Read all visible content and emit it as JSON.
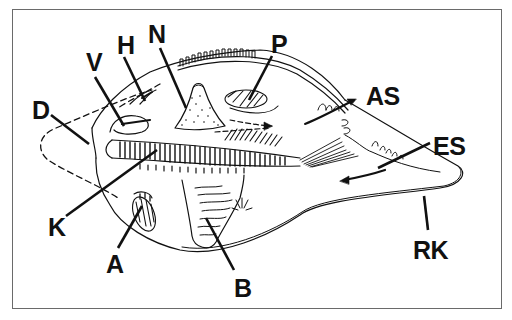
{
  "figure": {
    "labels": [
      {
        "id": "N",
        "text": "N",
        "x": 148,
        "y": 25
      },
      {
        "id": "H",
        "text": "H",
        "x": 118,
        "y": 36
      },
      {
        "id": "V",
        "text": "V",
        "x": 86,
        "y": 52
      },
      {
        "id": "P",
        "text": "P",
        "x": 272,
        "y": 34
      },
      {
        "id": "AS",
        "text": "AS",
        "x": 368,
        "y": 84
      },
      {
        "id": "D",
        "text": "D",
        "x": 32,
        "y": 98
      },
      {
        "id": "ES",
        "text": "ES",
        "x": 434,
        "y": 134
      },
      {
        "id": "K",
        "text": "K",
        "x": 47,
        "y": 214
      },
      {
        "id": "A",
        "text": "A",
        "x": 105,
        "y": 250
      },
      {
        "id": "RK",
        "text": "RK",
        "x": 412,
        "y": 237
      },
      {
        "id": "B",
        "text": "B",
        "x": 234,
        "y": 271
      }
    ]
  },
  "colors": {
    "ink": "#111111",
    "frame": "#6a6a6a",
    "background": "#ffffff"
  }
}
